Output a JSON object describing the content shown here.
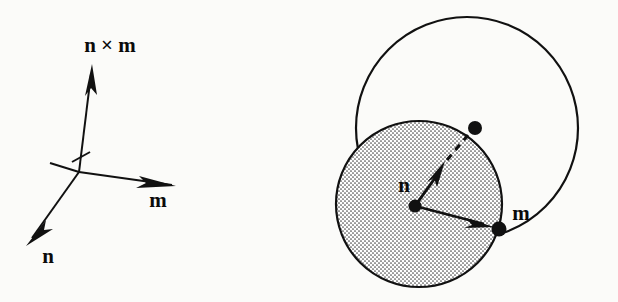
{
  "figure": {
    "background_color": "#fbfbf9",
    "ink_color": "#111111",
    "width": 618,
    "height": 302
  },
  "left_panel": {
    "name": "orthogonal-vector-triad",
    "origin": {
      "x": 79,
      "y": 172
    },
    "labels": {
      "cross_product": "n × m",
      "m": "m",
      "n": "n"
    },
    "label_positions": {
      "cross_product": {
        "x": 110,
        "y": 52
      },
      "m": {
        "x": 158,
        "y": 205
      },
      "n": {
        "x": 48,
        "y": 260
      }
    },
    "vectors": [
      {
        "name": "n-cross-m",
        "label": "n × m",
        "tip": {
          "x": 92,
          "y": 66
        },
        "direction": "up"
      },
      {
        "name": "m",
        "label": "m",
        "tip": {
          "x": 172,
          "y": 184
        },
        "direction": "right-down"
      },
      {
        "name": "n",
        "label": "n",
        "tip": {
          "x": 26,
          "y": 243
        },
        "direction": "left-down"
      },
      {
        "name": "axis-tail",
        "label": "",
        "tip": {
          "x": 50,
          "y": 163
        },
        "direction": "left-up"
      }
    ]
  },
  "right_panel": {
    "name": "rotating-sphere-diagram",
    "large_circle": {
      "cx": 467,
      "cy": 128,
      "r": 111,
      "fill": "none",
      "stroke": "#111111"
    },
    "shaded_circle": {
      "cx": 419,
      "cy": 204,
      "r": 83,
      "fill": "stipple",
      "stroke": "#111111"
    },
    "center_dot": {
      "x": 415,
      "y": 206,
      "r": 6
    },
    "labels": {
      "n": "n",
      "m": "m"
    },
    "label_positions": {
      "n": {
        "x": 404,
        "y": 191
      },
      "m": {
        "x": 520,
        "y": 218
      }
    },
    "vectors": [
      {
        "name": "n-vector",
        "label": "n",
        "from": {
          "x": 415,
          "y": 206
        },
        "arrow_tip": {
          "x": 443,
          "y": 166
        },
        "dashed_extension_to": {
          "x": 463,
          "y": 141
        },
        "endpoint_dot": {
          "x": 475,
          "y": 128,
          "r": 7
        },
        "style": "solid-with-dashed-extension"
      },
      {
        "name": "m-vector",
        "label": "m",
        "from": {
          "x": 415,
          "y": 206
        },
        "arrow_tip": {
          "x": 487,
          "y": 225
        },
        "endpoint_dot": {
          "x": 499,
          "y": 229,
          "r": 7
        },
        "style": "solid"
      }
    ]
  }
}
